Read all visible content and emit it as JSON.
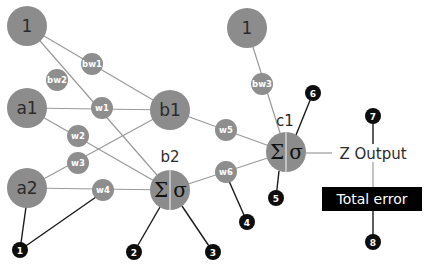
{
  "diagram": {
    "colors": {
      "node": "#8c8c8c",
      "edge": "#9a9a9a",
      "badge": "#0d0d0d",
      "error_box": "#000000"
    },
    "nodes": {
      "bias1": {
        "label": "1",
        "cx": 27,
        "cy": 26
      },
      "a1": {
        "label": "a1",
        "cx": 27,
        "cy": 108
      },
      "a2": {
        "label": "a2",
        "cx": 27,
        "cy": 188
      },
      "b1": {
        "label": "b1",
        "cx": 170,
        "cy": 110
      },
      "b2": {
        "label": "b2",
        "cx": 170,
        "cy": 190,
        "sum": "Σ",
        "act": "σ"
      },
      "bias2": {
        "label": "1",
        "cx": 247,
        "cy": 28
      },
      "c1": {
        "label": "c1",
        "cx": 286,
        "cy": 152,
        "sum": "Σ",
        "act": "σ"
      }
    },
    "weights": [
      {
        "label": "bw1",
        "cx": 92,
        "cy": 64
      },
      {
        "label": "bw2",
        "cx": 57,
        "cy": 80
      },
      {
        "label": "w1",
        "cx": 102,
        "cy": 108
      },
      {
        "label": "w2",
        "cx": 78,
        "cy": 136
      },
      {
        "label": "w3",
        "cx": 78,
        "cy": 163
      },
      {
        "label": "w4",
        "cx": 103,
        "cy": 190
      },
      {
        "label": "w5",
        "cx": 226,
        "cy": 130
      },
      {
        "label": "w6",
        "cx": 226,
        "cy": 172
      },
      {
        "label": "bw3",
        "cx": 262,
        "cy": 84
      }
    ],
    "output": {
      "label": "Z Output"
    },
    "total_error": {
      "label": "Total error"
    },
    "badges": [
      {
        "label": "1",
        "cx": 20,
        "cy": 250
      },
      {
        "label": "2",
        "cx": 134,
        "cy": 252
      },
      {
        "label": "3",
        "cx": 213,
        "cy": 252
      },
      {
        "label": "4",
        "cx": 247,
        "cy": 222
      },
      {
        "label": "5",
        "cx": 276,
        "cy": 198
      },
      {
        "label": "6",
        "cx": 313,
        "cy": 93
      },
      {
        "label": "7",
        "cx": 373,
        "cy": 116
      },
      {
        "label": "8",
        "cx": 373,
        "cy": 242
      }
    ]
  }
}
